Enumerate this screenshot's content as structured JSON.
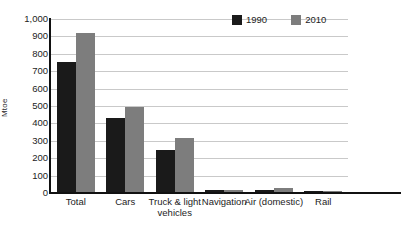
{
  "chart_data": {
    "type": "bar",
    "title": "",
    "subtitle": "",
    "xlabel": "",
    "ylabel": "Mtoe",
    "ylim": [
      0,
      1000
    ],
    "yticks": [
      0,
      100,
      200,
      300,
      400,
      500,
      600,
      700,
      800,
      900,
      1000
    ],
    "ytick_labels": [
      "0",
      "100",
      "200",
      "300",
      "400",
      "500",
      "600",
      "700",
      "800",
      "900",
      "1,000"
    ],
    "grid": true,
    "legend_position": "top-right",
    "categories": [
      "Total",
      "Cars",
      "Truck & light vehicles",
      "Navigation",
      "Air (domestic)",
      "Rail"
    ],
    "series": [
      {
        "name": "1990",
        "color": "#1a1a1a",
        "values": [
          753,
          430,
          247,
          18,
          16,
          11
        ]
      },
      {
        "name": "2010",
        "color": "#7d7d7d",
        "values": [
          920,
          495,
          316,
          20,
          31,
          8
        ]
      }
    ]
  },
  "legend": {
    "entries": [
      {
        "label": "1990",
        "color": "#1a1a1a"
      },
      {
        "label": "2010",
        "color": "#7d7d7d"
      }
    ]
  },
  "axis": {
    "y_title": "Mtoe"
  },
  "category_label_lines": [
    [
      "Total"
    ],
    [
      "Cars"
    ],
    [
      "Truck & light",
      "vehicles"
    ],
    [
      "Navigation"
    ],
    [
      "Air (domestic)"
    ],
    [
      "Rail"
    ]
  ]
}
